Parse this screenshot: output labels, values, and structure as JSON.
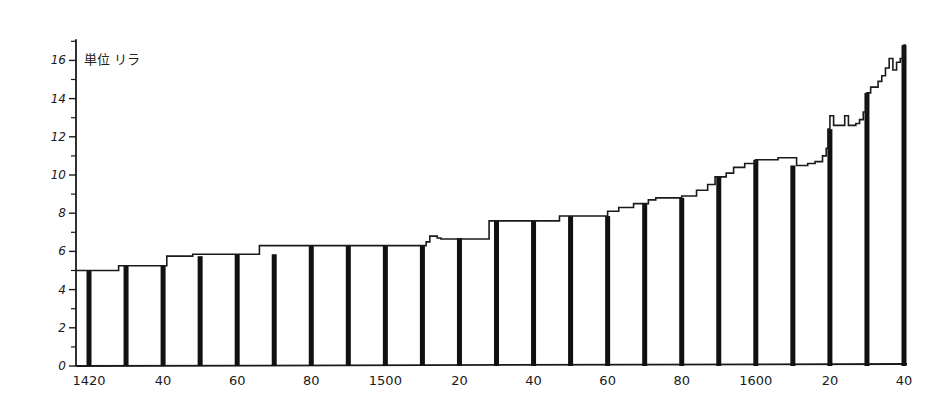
{
  "chart_data": {
    "type": "line",
    "subtype": "step-with-decade-bars",
    "title": "",
    "unit_label": "単位 リラ",
    "xlabel": "",
    "ylabel": "単位 リラ",
    "xlim": [
      1420,
      1640
    ],
    "ylim": [
      0,
      17
    ],
    "grid": false,
    "legend": null,
    "y_ticks": [
      0,
      2,
      4,
      6,
      8,
      10,
      12,
      14,
      16
    ],
    "y_minor_ticks": [
      1,
      3,
      5,
      7,
      9,
      11,
      13,
      15,
      17
    ],
    "x_tick_labels": [
      {
        "year": 1420,
        "label": "1420"
      },
      {
        "year": 1440,
        "label": "40"
      },
      {
        "year": 1460,
        "label": "60"
      },
      {
        "year": 1480,
        "label": "80"
      },
      {
        "year": 1500,
        "label": "1500"
      },
      {
        "year": 1520,
        "label": "20"
      },
      {
        "year": 1540,
        "label": "40"
      },
      {
        "year": 1560,
        "label": "60"
      },
      {
        "year": 1580,
        "label": "80"
      },
      {
        "year": 1600,
        "label": "1600"
      },
      {
        "year": 1620,
        "label": "20"
      },
      {
        "year": 1640,
        "label": "40"
      }
    ],
    "decade_bars": {
      "years": [
        1420,
        1430,
        1440,
        1450,
        1460,
        1470,
        1480,
        1490,
        1500,
        1510,
        1520,
        1530,
        1540,
        1550,
        1560,
        1570,
        1580,
        1590,
        1600,
        1610,
        1620,
        1630,
        1640
      ],
      "values": [
        5.0,
        5.25,
        5.25,
        5.75,
        5.85,
        5.85,
        6.3,
        6.3,
        6.3,
        6.3,
        6.7,
        7.6,
        7.6,
        7.85,
        7.85,
        8.5,
        8.8,
        9.9,
        10.8,
        10.5,
        12.4,
        14.3,
        16.8
      ]
    },
    "series": [
      {
        "name": "price (lire)",
        "step_points": [
          [
            1420,
            5.0
          ],
          [
            1428,
            5.25
          ],
          [
            1441,
            5.75
          ],
          [
            1448,
            5.85
          ],
          [
            1466,
            6.3
          ],
          [
            1511,
            6.5
          ],
          [
            1512,
            6.8
          ],
          [
            1514,
            6.7
          ],
          [
            1515,
            6.65
          ],
          [
            1528,
            7.6
          ],
          [
            1547,
            7.85
          ],
          [
            1560,
            8.1
          ],
          [
            1563,
            8.3
          ],
          [
            1567,
            8.5
          ],
          [
            1571,
            8.7
          ],
          [
            1573,
            8.8
          ],
          [
            1580,
            8.9
          ],
          [
            1584,
            9.2
          ],
          [
            1587,
            9.5
          ],
          [
            1589,
            9.9
          ],
          [
            1592,
            10.1
          ],
          [
            1594,
            10.4
          ],
          [
            1597,
            10.6
          ],
          [
            1600,
            10.8
          ],
          [
            1606,
            10.9
          ],
          [
            1610,
            10.9
          ],
          [
            1611,
            10.5
          ],
          [
            1614,
            10.6
          ],
          [
            1616,
            10.7
          ],
          [
            1618,
            11.0
          ],
          [
            1619,
            11.4
          ],
          [
            1619.5,
            12.4
          ],
          [
            1620,
            13.1
          ],
          [
            1621,
            12.6
          ],
          [
            1623,
            12.6
          ],
          [
            1624,
            13.1
          ],
          [
            1625,
            12.6
          ],
          [
            1627,
            12.7
          ],
          [
            1628,
            12.9
          ],
          [
            1629,
            13.3
          ],
          [
            1630,
            14.3
          ],
          [
            1631,
            14.6
          ],
          [
            1633,
            14.9
          ],
          [
            1634,
            15.2
          ],
          [
            1635,
            15.6
          ],
          [
            1636,
            16.1
          ],
          [
            1637,
            15.5
          ],
          [
            1638,
            15.9
          ],
          [
            1639,
            16.1
          ],
          [
            1640,
            16.8
          ]
        ]
      }
    ]
  }
}
